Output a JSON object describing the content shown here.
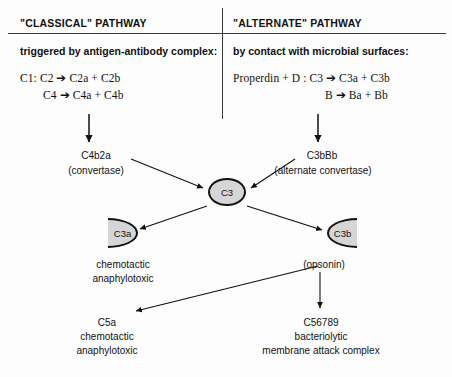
{
  "diagram": {
    "title_left": "\"CLASSICAL\" PATHWAY",
    "title_right": "\"ALTERNATE\" PATHWAY",
    "lead_left": "triggered by antigen-antibody complex:",
    "lead_right": "by contact with microbial surfaces:",
    "equations_left": [
      "C1: C2 ➔ C2a + C2b",
      "C4 ➔ C4a + C4b"
    ],
    "equations_right": [
      "Properdin + D : C3 ➔ C3a + C3b",
      "B ➔ Ba  +  Bb"
    ],
    "nodes": {
      "convertase_left": "C4b2a",
      "convertase_left_sub": "(convertase)",
      "convertase_right": "C3bBb",
      "convertase_right_sub": "(alternate convertase)",
      "c3": "C3",
      "c3a": "C3a",
      "c3b": "C3b",
      "c3a_caption_1": "chemotactic",
      "c3a_caption_2": "anaphylotoxic",
      "c3b_caption": "(opsonin)",
      "c5a": "C5a",
      "c5a_caption_1": "chemotactic",
      "c5a_caption_2": "anaphylotoxic",
      "mac": "C56789",
      "mac_caption_1": "bacteriolytic",
      "mac_caption_2": "membrane attack complex"
    },
    "colors": {
      "ink": "#111111",
      "rule": "#3a3a3a",
      "node_fill": "#d6d6d6",
      "background": "#fdfdfd"
    }
  }
}
